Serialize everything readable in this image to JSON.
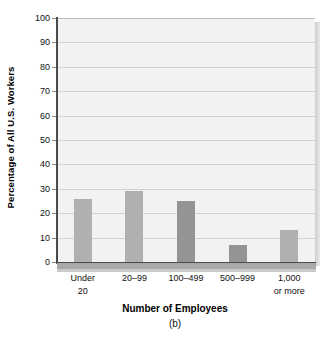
{
  "chart_data": {
    "type": "bar",
    "title": "",
    "xlabel": "Number of Employees",
    "ylabel": "Percentage of All U.S. Workers",
    "panel_label": "(b)",
    "categories": [
      "Under\n20",
      "20–99",
      "100–499",
      "500–999",
      "1,000\nor more"
    ],
    "category_labels_flat": [
      "Under 20",
      "20–99",
      "100–499",
      "500–999",
      "1,000 or more"
    ],
    "values": [
      26,
      29,
      25,
      7,
      13
    ],
    "bar_colors": [
      "#b0b0ae",
      "#b0b0ae",
      "#949492",
      "#949492",
      "#b0b0ae"
    ],
    "ylim": [
      0,
      100
    ],
    "ytick_step": 10,
    "yticks": [
      100,
      90,
      80,
      70,
      60,
      50,
      40,
      30,
      20,
      10,
      0
    ],
    "ytick_labels": [
      "100",
      "90",
      "80",
      "70",
      "60",
      "50",
      "40",
      "30",
      "20",
      "10",
      "0"
    ],
    "grid": true,
    "grid_axis": "y",
    "legend": false,
    "plot_background": "#f2f2f1",
    "gridline_color": "#d2d2d0",
    "axis_color": "#4a4a4a"
  }
}
